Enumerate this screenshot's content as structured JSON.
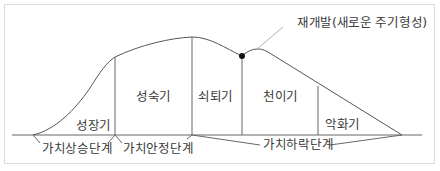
{
  "diagram": {
    "type": "product life cycle curve",
    "annotation": "재개발(새로운 주기형성)",
    "stages": [
      {
        "id": "growth",
        "label": "성장기"
      },
      {
        "id": "maturity",
        "label": "성숙기"
      },
      {
        "id": "decline",
        "label": "쇠퇴기"
      },
      {
        "id": "transition",
        "label": "천이기"
      },
      {
        "id": "deterioration",
        "label": "악화기"
      }
    ],
    "phases": [
      {
        "id": "value-rise",
        "label": "가치상승단계"
      },
      {
        "id": "value-stable",
        "label": "가치안정단계"
      },
      {
        "id": "value-fall",
        "label": "가치하락단계"
      }
    ],
    "colors": {
      "line": "#555555",
      "text": "#3a3a3a",
      "dot": "#111111",
      "leader": "#b0b0b0",
      "border": "#dcdcdc"
    }
  }
}
